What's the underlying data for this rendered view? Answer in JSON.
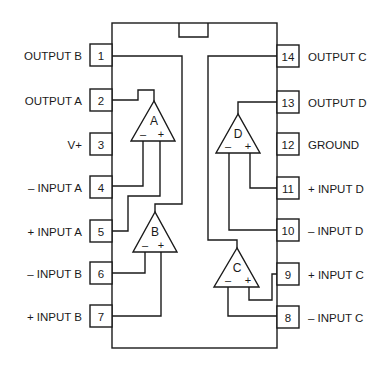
{
  "diagram": {
    "pins_left": [
      {
        "number": "1",
        "label": "OUTPUT B"
      },
      {
        "number": "2",
        "label": "OUTPUT A"
      },
      {
        "number": "3",
        "label": "V+"
      },
      {
        "number": "4",
        "label": "– INPUT A"
      },
      {
        "number": "5",
        "label": "+ INPUT A"
      },
      {
        "number": "6",
        "label": "– INPUT B"
      },
      {
        "number": "7",
        "label": "+ INPUT B"
      }
    ],
    "pins_right": [
      {
        "number": "14",
        "label": "OUTPUT C"
      },
      {
        "number": "13",
        "label": "OUTPUT D"
      },
      {
        "number": "12",
        "label": "GROUND"
      },
      {
        "number": "11",
        "label": "+ INPUT D"
      },
      {
        "number": "10",
        "label": "– INPUT D"
      },
      {
        "number": "9",
        "label": "+ INPUT C"
      },
      {
        "number": "8",
        "label": "– INPUT C"
      }
    ],
    "amplifiers": [
      {
        "name": "A",
        "minus": "–",
        "plus": "+"
      },
      {
        "name": "B",
        "minus": "–",
        "plus": "+"
      },
      {
        "name": "C",
        "minus": "–",
        "plus": "+"
      },
      {
        "name": "D",
        "minus": "–",
        "plus": "+"
      }
    ],
    "colors": {
      "ink": "#1a1a1a",
      "background": "#ffffff"
    }
  }
}
